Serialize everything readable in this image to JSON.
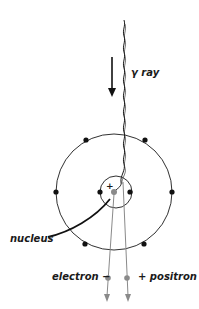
{
  "diagram": {
    "labels": {
      "gamma_ray": "γ ray",
      "nucleus": "nucleus",
      "electron": "electron −",
      "positron": "+ positron",
      "nucleus_charge": "+"
    },
    "colors": {
      "line": "#1a1a1a",
      "particle_track": "#8a8a8a",
      "nucleus_dot": "#8a8a8a",
      "electron_dot": "#111111",
      "background": "#ffffff"
    },
    "atom": {
      "outer_shell_electrons": 6,
      "inner_shell_electrons": 2
    }
  }
}
